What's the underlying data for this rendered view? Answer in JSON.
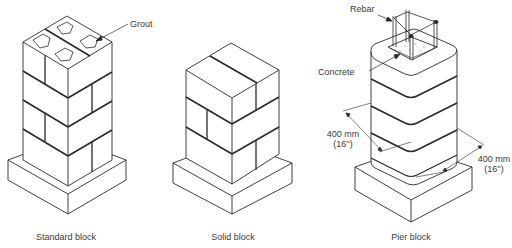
{
  "figures": [
    {
      "id": "standard",
      "caption": "Standard block",
      "callouts": [
        {
          "label": "Grout"
        }
      ]
    },
    {
      "id": "solid",
      "caption": "Solid block",
      "callouts": []
    },
    {
      "id": "pier",
      "caption": "Pier block",
      "callouts": [
        {
          "label": "Rebar"
        },
        {
          "label": "Concrete"
        }
      ],
      "dimensions": [
        {
          "metric": "400 mm",
          "imperial": "(16'')"
        },
        {
          "metric": "400 mm",
          "imperial": "(16'')"
        }
      ]
    }
  ],
  "colors": {
    "line": "#2a2a2a",
    "background": "#ffffff",
    "text": "#3a3a3a"
  }
}
